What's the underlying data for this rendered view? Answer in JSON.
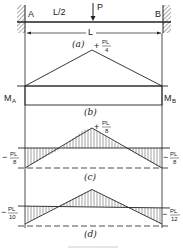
{
  "figure": {
    "beam": {
      "support_left_label": "A",
      "support_right_label": "B",
      "load_label": "P",
      "load_position_label": "L/2",
      "span_label": "L"
    },
    "panels": [
      {
        "id": "a",
        "caption": "(a)"
      },
      {
        "id": "b",
        "caption": "(b)",
        "peak_label_num": "PL",
        "peak_label_den": "4",
        "peak_sign": "+",
        "left_end_label": "M",
        "left_end_sub": "A",
        "right_end_label": "M",
        "right_end_sub": "B"
      },
      {
        "id": "c",
        "caption": "(c)",
        "peak_label_num": "PL",
        "peak_label_den": "8",
        "peak_sign": "+",
        "left_label_num": "PL",
        "left_label_den": "8",
        "left_sign": "−",
        "right_label_num": "PL",
        "right_label_den": "8",
        "right_sign": "−"
      },
      {
        "id": "d",
        "caption": "(d)",
        "left_label_num": "PL",
        "left_label_den": "10",
        "left_sign": "−",
        "right_label_num": "PL",
        "right_label_den": "12",
        "right_sign": "−"
      }
    ]
  },
  "colors": {
    "ink": "#222222",
    "hatch": "#555555",
    "background": "#ffffff"
  }
}
